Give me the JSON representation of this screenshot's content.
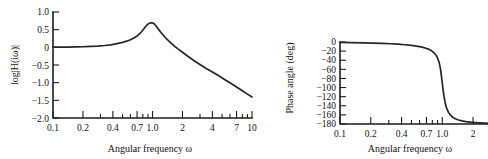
{
  "figure": {
    "background": "#ffffff",
    "ink": "#262626"
  },
  "chart_data": [
    {
      "id": "magnitude",
      "type": "line",
      "title": "",
      "xlabel": "Angular frequency ω",
      "ylabel": "log|H(iω)|",
      "xscale": "log",
      "xlim": [
        0.1,
        10
      ],
      "ylim": [
        -2.0,
        1.0
      ],
      "grid": false,
      "legend": "none",
      "xticks": [
        0.1,
        0.2,
        0.4,
        0.7,
        1.0,
        2,
        4,
        7,
        10
      ],
      "xticklabels": [
        "0.1",
        "0.2",
        "0.4",
        "0.7",
        "1.0",
        "2",
        "4",
        "7",
        "10"
      ],
      "xminorticks": [
        0.1,
        0.2,
        0.3,
        0.4,
        0.5,
        0.6,
        0.7,
        0.8,
        0.9,
        1.0,
        2,
        3,
        4,
        5,
        6,
        7,
        8,
        9,
        10
      ],
      "yticks": [
        1.0,
        0.5,
        0,
        -0.5,
        -1.0,
        -1.5,
        -2.0
      ],
      "yticklabels": [
        "1.0",
        "0.5",
        "0",
        "−0.5",
        "−1.0",
        "−1.5",
        "−2.0"
      ],
      "series": [
        {
          "name": "log|H(iω)|",
          "color": "#262626",
          "x": [
            0.1,
            0.12,
            0.14,
            0.17,
            0.2,
            0.24,
            0.28,
            0.33,
            0.38,
            0.44,
            0.5,
            0.55,
            0.6,
            0.65,
            0.7,
            0.74,
            0.78,
            0.82,
            0.85,
            0.88,
            0.9,
            0.92,
            0.94,
            0.96,
            0.97,
            0.98,
            0.99,
            1.0,
            1.01,
            1.02,
            1.04,
            1.06,
            1.09,
            1.12,
            1.16,
            1.2,
            1.26,
            1.33,
            1.41,
            1.5,
            1.65,
            1.8,
            2.0,
            2.3,
            2.6,
            3.0,
            3.5,
            4.0,
            4.6,
            5.3,
            6.0,
            7.0,
            8.0,
            9.0,
            10.0
          ],
          "y": [
            0.004,
            0.006,
            0.008,
            0.012,
            0.017,
            0.026,
            0.036,
            0.052,
            0.072,
            0.103,
            0.14,
            0.174,
            0.214,
            0.263,
            0.323,
            0.38,
            0.448,
            0.524,
            0.58,
            0.632,
            0.656,
            0.673,
            0.684,
            0.69,
            0.691,
            0.692,
            0.692,
            0.69,
            0.686,
            0.68,
            0.663,
            0.64,
            0.6,
            0.553,
            0.494,
            0.44,
            0.37,
            0.293,
            0.218,
            0.148,
            0.043,
            -0.042,
            -0.14,
            -0.268,
            -0.372,
            -0.486,
            -0.605,
            -0.698,
            -0.8,
            -0.908,
            -1.0,
            -1.124,
            -1.231,
            -1.324,
            -1.407
          ]
        }
      ]
    },
    {
      "id": "phase",
      "type": "line",
      "title": "",
      "xlabel": "Angular frequency ω",
      "ylabel": "Phase angle (deg)",
      "xscale": "log",
      "xlim": [
        0.1,
        2.8
      ],
      "ylim": [
        -180,
        0
      ],
      "grid": false,
      "legend": "none",
      "xticks": [
        0.1,
        0.2,
        0.4,
        0.7,
        1.0,
        2
      ],
      "xticklabels": [
        "0.1",
        "0.2",
        "0.4",
        "0.7",
        "1.0",
        "2"
      ],
      "xminorticks": [
        0.1,
        0.2,
        0.3,
        0.4,
        0.5,
        0.6,
        0.7,
        0.8,
        0.9,
        1.0,
        2
      ],
      "yticks": [
        0,
        -20,
        -40,
        -60,
        -80,
        -100,
        -120,
        -140,
        -160,
        -180
      ],
      "yticklabels": [
        "0",
        "−20",
        "−40",
        "−60",
        "−80",
        "−100",
        "−120",
        "−140",
        "−160",
        "−180"
      ],
      "series": [
        {
          "name": "Phase angle (deg)",
          "color": "#262626",
          "x": [
            0.1,
            0.13,
            0.17,
            0.21,
            0.26,
            0.31,
            0.37,
            0.43,
            0.5,
            0.56,
            0.62,
            0.68,
            0.73,
            0.78,
            0.82,
            0.86,
            0.89,
            0.92,
            0.94,
            0.96,
            0.97,
            0.98,
            0.99,
            1.0,
            1.01,
            1.02,
            1.03,
            1.04,
            1.06,
            1.08,
            1.11,
            1.15,
            1.2,
            1.26,
            1.34,
            1.44,
            1.56,
            1.7,
            1.9,
            2.1,
            2.35,
            2.6,
            2.8
          ],
          "y": [
            -1.0,
            -1.3,
            -1.8,
            -2.3,
            -3.0,
            -3.8,
            -4.8,
            -6.0,
            -7.6,
            -9.0,
            -10.8,
            -13.2,
            -15.6,
            -18.8,
            -22.4,
            -27.5,
            -33.0,
            -41.0,
            -48.5,
            -59.0,
            -66.0,
            -74.0,
            -82.0,
            -90.0,
            -98.0,
            -106.0,
            -113.0,
            -119.5,
            -130.0,
            -138.5,
            -147.0,
            -154.5,
            -160.5,
            -165.0,
            -168.5,
            -171.2,
            -173.2,
            -174.7,
            -176.0,
            -176.8,
            -177.5,
            -178.0,
            -178.3
          ]
        }
      ]
    }
  ]
}
